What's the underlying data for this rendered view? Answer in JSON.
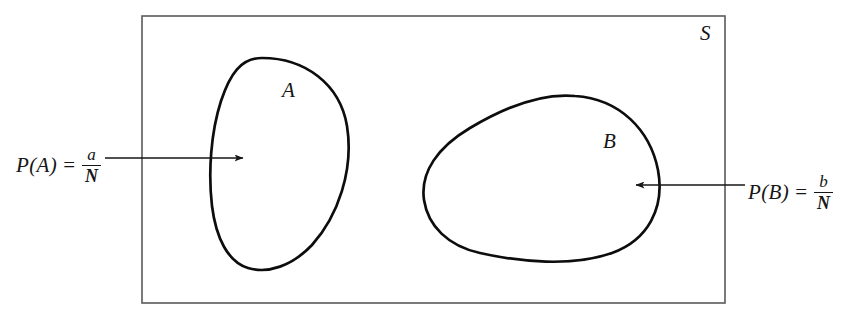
{
  "diagram": {
    "type": "venn-probability-sample-space",
    "background_color": "#ffffff",
    "stroke_color": "#161616",
    "sample_space": {
      "name": "sample-space-rectangle",
      "label": "S",
      "label_position": "top-right-inside",
      "bounds": {
        "x": 142,
        "y": 16,
        "width": 583,
        "height": 287
      },
      "stroke_width": 1.6
    },
    "regions": [
      {
        "id": "A",
        "name": "event-region-a",
        "label": "A",
        "shape": "egg-oval-vertical",
        "bounds": {
          "x": 212,
          "y": 58,
          "width": 136,
          "height": 214
        },
        "stroke_width": 2.6
      },
      {
        "id": "B",
        "name": "event-region-b",
        "label": "B",
        "shape": "egg-oval-horizontal",
        "bounds": {
          "x": 424,
          "y": 95,
          "width": 236,
          "height": 166
        },
        "stroke_width": 2.6
      }
    ],
    "annotations": [
      {
        "id": "pa",
        "name": "probability-a-annotation",
        "lhs": "P(A)",
        "equals": "=",
        "numerator": "a",
        "denominator": "N",
        "plain_text": "P(A) = a/N",
        "arrow": {
          "name": "arrow-to-region-a",
          "direction": "right",
          "from": {
            "x": 105,
            "y": 158
          },
          "to": {
            "x": 246,
            "y": 158
          }
        }
      },
      {
        "id": "pb",
        "name": "probability-b-annotation",
        "lhs": "P(B)",
        "equals": "=",
        "numerator": "b",
        "denominator": "N",
        "plain_text": "P(B) = b/N",
        "arrow": {
          "name": "arrow-to-region-b",
          "direction": "left",
          "from": {
            "x": 745,
            "y": 185
          },
          "to": {
            "x": 633,
            "y": 185
          }
        }
      }
    ]
  }
}
